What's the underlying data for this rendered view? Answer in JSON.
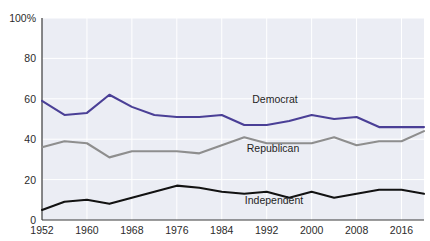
{
  "chart_data": {
    "type": "line",
    "title": "",
    "xlabel": "",
    "ylabel": "",
    "ylim": [
      0,
      100
    ],
    "xlim": [
      1952,
      2020
    ],
    "grid": true,
    "legend_position": "inline-labels",
    "y_ticks": [
      "0",
      "20",
      "40",
      "60",
      "80",
      "100%"
    ],
    "y_tick_values": [
      0,
      20,
      40,
      60,
      80,
      100
    ],
    "x_ticks": [
      "1952",
      "1960",
      "1968",
      "1976",
      "1984",
      "1992",
      "2000",
      "2008",
      "2016"
    ],
    "x_tick_values": [
      1952,
      1960,
      1968,
      1976,
      1984,
      1992,
      2000,
      2008,
      2016
    ],
    "x": [
      1952,
      1956,
      1960,
      1964,
      1968,
      1972,
      1976,
      1980,
      1984,
      1988,
      1992,
      1996,
      2000,
      2004,
      2008,
      2012,
      2016,
      2020
    ],
    "series": [
      {
        "name": "Democrat",
        "color": "#4a3f96",
        "values": [
          59,
          52,
          53,
          62,
          56,
          52,
          51,
          51,
          52,
          47,
          47,
          49,
          52,
          50,
          51,
          46,
          46,
          46
        ]
      },
      {
        "name": "Republican",
        "color": "#8e8e8e",
        "values": [
          36,
          39,
          38,
          31,
          34,
          34,
          34,
          33,
          37,
          41,
          38,
          38,
          38,
          41,
          37,
          39,
          39,
          44
        ]
      },
      {
        "name": "Independent",
        "color": "#121212",
        "values": [
          5,
          9,
          10,
          8,
          11,
          14,
          17,
          16,
          14,
          13,
          14,
          11,
          14,
          11,
          13,
          15,
          15,
          13
        ]
      }
    ],
    "inline_labels": [
      {
        "text": "Democrat",
        "x": 275,
        "y": 103
      },
      {
        "text": "Republican",
        "x": 273,
        "y": 152
      },
      {
        "text": "Independent",
        "x": 274,
        "y": 204
      }
    ],
    "plot_background": "#ebedf4",
    "gridline_color": "#ffffff",
    "axis_color": "#3a3a3a"
  }
}
